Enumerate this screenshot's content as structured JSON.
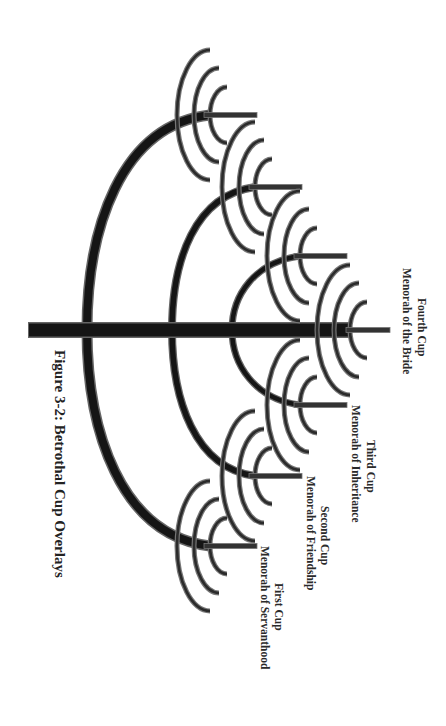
{
  "figure": {
    "caption": "Figure 3-2: Betrothal Cup Overlays",
    "colors": {
      "stroke_dark": "#1a1a1a",
      "stroke_outline": "#777777",
      "background": "#ffffff",
      "text": "#2a2a2a"
    }
  },
  "cups": [
    {
      "title": "First Cup",
      "subtitle": "Menorah of Servanthood"
    },
    {
      "title": "Second Cup",
      "subtitle": "Menorah of Friendship"
    },
    {
      "title": "Third Cup",
      "subtitle": "Menorah of Inheritance"
    },
    {
      "title": "Fourth Cup",
      "subtitle": "Menorah of the Bride"
    }
  ],
  "menorahs": [
    {
      "id": "m1",
      "cx": 210,
      "cy": 546,
      "stem_end": 257
    },
    {
      "id": "m2",
      "cx": 255,
      "cy": 476,
      "stem_end": 302
    },
    {
      "id": "m3",
      "cx": 300,
      "cy": 405,
      "stem_end": 347
    },
    {
      "id": "m4",
      "cx": 350,
      "cy": 330,
      "stem_end": 390
    },
    {
      "id": "m5",
      "cx": 300,
      "cy": 256,
      "stem_end": 347
    },
    {
      "id": "m6",
      "cx": 255,
      "cy": 187,
      "stem_end": 302
    },
    {
      "id": "m7",
      "cx": 210,
      "cy": 115,
      "stem_end": 257
    }
  ]
}
